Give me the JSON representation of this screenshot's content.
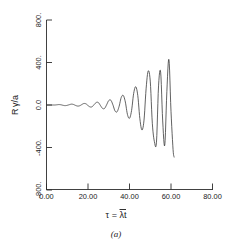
{
  "figure": {
    "caption": "(a)",
    "xlabel_tau": "τ",
    "xlabel_eq": " = ",
    "xlabel_lambda": "λ",
    "xlabel_t": "t",
    "ylabel_R": "R",
    "ylabel_gamma": "γ",
    "ylabel_slash_a": "/a"
  },
  "chart_data": {
    "type": "line",
    "title": "",
    "subtitle": "",
    "caption": "(a)",
    "xlabel": "τ = λ̄t",
    "ylabel": "R γ/a",
    "xlim": [
      0.0,
      80.0
    ],
    "ylim": [
      -800.0,
      800.0
    ],
    "xticks": [
      0.0,
      20.0,
      40.0,
      60.0,
      80.0
    ],
    "xticklabels": [
      "0.00",
      "20.00",
      "40.00",
      "60.00",
      "80.00"
    ],
    "yticks": [
      -800.0,
      -400.0,
      0.0,
      400.0,
      800.0
    ],
    "yticklabels": [
      "-800.",
      "-400.",
      "0.0",
      "400.",
      "800."
    ],
    "grid": false,
    "legend": null,
    "legend_position": "none",
    "series": [
      {
        "name": "Rγ/a",
        "description": "Exponentially growing oscillation, terminating abruptly near τ = 61.5",
        "x": [
          0.0,
          1.0,
          2.0,
          3.0,
          4.0,
          5.0,
          6.0,
          7.0,
          8.0,
          9.0,
          10.0,
          11.0,
          12.0,
          13.0,
          14.0,
          15.0,
          16.0,
          17.0,
          18.0,
          19.0,
          20.0,
          21.0,
          22.0,
          23.0,
          24.0,
          25.0,
          26.0,
          27.0,
          28.0,
          29.0,
          30.0,
          31.0,
          32.0,
          33.0,
          34.0,
          35.0,
          36.0,
          37.0,
          38.0,
          39.0,
          40.0,
          41.0,
          42.0,
          43.0,
          44.0,
          45.0,
          46.0,
          47.0,
          48.0,
          49.0,
          50.0,
          51.0,
          52.0,
          53.0,
          54.0,
          55.0,
          56.0,
          57.0,
          58.0,
          59.0,
          60.0,
          61.0,
          61.5
        ],
        "y": [
          0,
          0,
          0,
          0,
          0,
          2,
          4,
          2,
          -3,
          -6,
          -3,
          3,
          8,
          5,
          -4,
          -10,
          -7,
          4,
          14,
          11,
          -5,
          -18,
          -16,
          5,
          24,
          23,
          -5,
          -32,
          -32,
          3,
          42,
          45,
          2,
          -55,
          -64,
          -12,
          70,
          90,
          28,
          -88,
          -125,
          -52,
          108,
          172,
          88,
          -130,
          -235,
          -142,
          152,
          320,
          225,
          -172,
          -345,
          -350,
          180,
          310,
          -150,
          -378,
          125,
          430,
          -60,
          -420,
          -490
        ]
      }
    ],
    "annotations": [
      {
        "text": "(a)",
        "position": "below-axis-center"
      }
    ]
  }
}
